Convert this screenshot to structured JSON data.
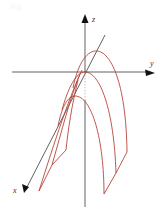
{
  "figure": {
    "watermark": "vl.g",
    "axes": {
      "z": {
        "label": "z",
        "color": "#111111"
      },
      "y": {
        "label": "y",
        "color": "#111111"
      },
      "x": {
        "label": "x",
        "color": "#111111"
      }
    },
    "curve_color": "#b5453a",
    "traces": [
      {
        "name": "front-parabola",
        "shape": "downward parabola (largest, right)"
      },
      {
        "name": "middle-parabola",
        "shape": "downward parabola (through origin)"
      },
      {
        "name": "back-parabola",
        "shape": "downward parabola (lowest, left)"
      }
    ]
  }
}
